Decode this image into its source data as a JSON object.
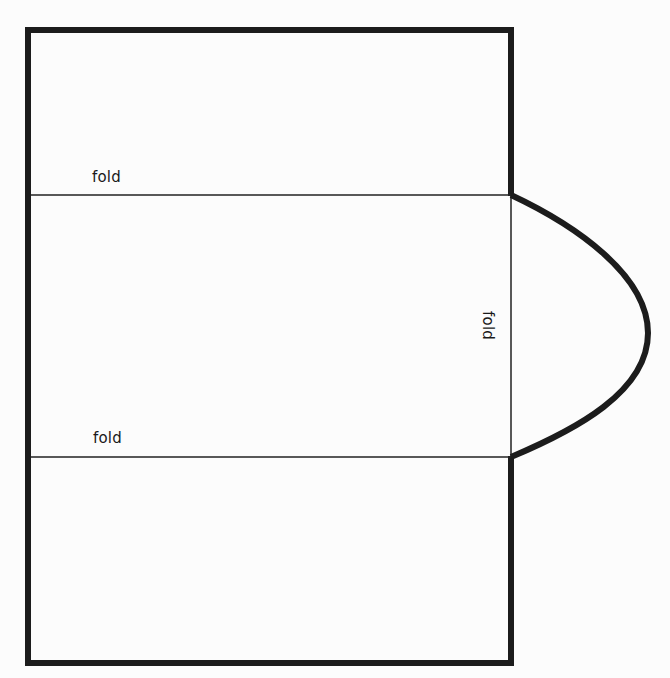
{
  "diagram": {
    "type": "folding-template",
    "colors": {
      "outline": "#1c1c1c",
      "fold_line": "#222222",
      "paper": "#fcfcfc",
      "label": "#1a1a1a"
    },
    "outline": {
      "rect": {
        "x": 28,
        "y": 30,
        "width": 483,
        "height": 633
      },
      "stroke_width": 6
    },
    "fold_lines": {
      "top_y": 195,
      "bottom_y": 457,
      "vertical_x": 511
    },
    "flap": {
      "start": {
        "x": 511,
        "y": 195
      },
      "apex": {
        "x": 648,
        "y": 335
      },
      "end": {
        "x": 511,
        "y": 457
      }
    },
    "labels": {
      "top_fold": "fold",
      "bottom_fold": "fold",
      "side_fold": "fold"
    }
  }
}
